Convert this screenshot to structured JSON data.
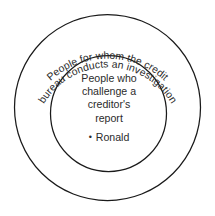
{
  "diagram": {
    "type": "venn-nested-circles",
    "background_color": "#ffffff",
    "stroke_color": "#1a1a1a",
    "text_color": "#2b2b2b",
    "outer_set": {
      "label_full": "People for whom the credit bureau conducts an investigation",
      "label_line_1": "People for whom the credit",
      "label_line_2": "bureau conducts an investigation",
      "center_x": 107.5,
      "center_y": 107.5,
      "radius": 93.5
    },
    "inner_set": {
      "label_full": "People who challenge a creditor's report",
      "label_line_1": "People who",
      "label_line_2": "challenge a",
      "label_line_3": "creditor's",
      "label_line_4": "report",
      "center_x": 108.5,
      "center_y": 113.5,
      "radius": 58.5
    },
    "members": [
      {
        "bullet": "•",
        "name": "Ronald"
      }
    ]
  }
}
